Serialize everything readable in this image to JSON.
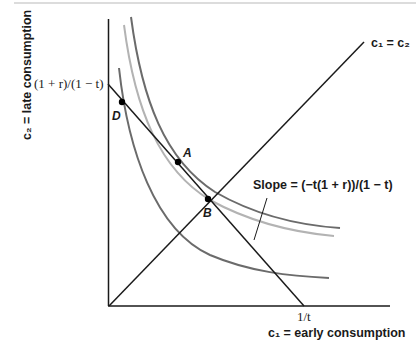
{
  "diagram": {
    "axes": {
      "y_label": "c₂ = late consumption",
      "x_label": "c₁ = early consumption",
      "y_intercept_label": "(1 + r)/(1 − t)",
      "x_intercept_label": "1/t"
    },
    "lines": {
      "diagonal_label": "c₁ = c₂",
      "slope_label": "Slope = (−t(1 + r))/(1 − t)"
    },
    "points": [
      {
        "label": "D"
      },
      {
        "label": "A"
      },
      {
        "label": "B"
      }
    ],
    "curves": [
      {
        "name": "inner-indifference-curve",
        "color": "#6b6b6b"
      },
      {
        "name": "middle-indifference-curve",
        "color": "#b3b3b3"
      },
      {
        "name": "outer-indifference-curve",
        "color": "#6b6b6b"
      }
    ],
    "colors": {
      "axis": "#1a1a1a",
      "dark_curve": "#6b6b6b",
      "light_curve": "#b3b3b3"
    }
  }
}
